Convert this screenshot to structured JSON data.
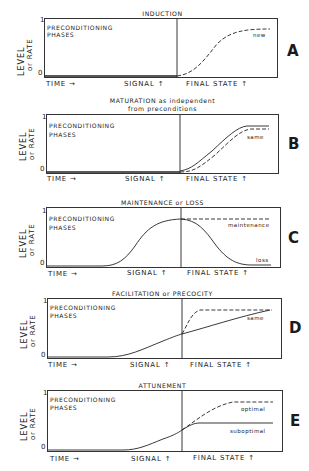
{
  "figure": {
    "y_axis_label_line1": "LEVEL",
    "y_axis_label_line2": "or RATE",
    "y_tick_top": "1",
    "y_tick_bottom": "0",
    "x_label_time": "TIME →",
    "x_label_signal": "SIGNAL ↑",
    "x_label_final": "FINAL STATE ↑",
    "preconditioning_line1": "PRECONDITIONING",
    "preconditioning_line2": "PHASES"
  },
  "panels": [
    {
      "letter": "A",
      "title": "INDUCTION",
      "curves": [
        {
          "style": "dashed",
          "label": "new",
          "description": "rises sigmoidally from 0 after signal to ~0.85"
        }
      ]
    },
    {
      "letter": "B",
      "title_line1": "MATURATION as independent",
      "title_line2": "from preconditions",
      "curves": [
        {
          "style": "solid",
          "label": "",
          "description": "rises from 0 after signal to ~0.85"
        },
        {
          "style": "dashed",
          "label": "same",
          "description": "parallel to solid, slightly lower, ~0.78"
        }
      ]
    },
    {
      "letter": "C",
      "title": "MAINTENANCE or LOSS",
      "curves": [
        {
          "style": "solid",
          "label": "loss",
          "description": "rises during preconditioning to ~0.85 at signal, then falls to ~0.03"
        },
        {
          "style": "dashed",
          "label": "maintenance",
          "description": "stays at ~0.85 after signal"
        }
      ]
    },
    {
      "letter": "D",
      "title": "FACILITATION or PRECOCITY",
      "curves": [
        {
          "style": "solid",
          "label": "same",
          "description": "slow rise from 0 to ~0.38 at signal, continues to ~0.82"
        },
        {
          "style": "dashed",
          "label": "",
          "description": "rapid rise after signal to ~0.82"
        }
      ]
    },
    {
      "letter": "E",
      "title": "ATTUNEMENT",
      "curves": [
        {
          "style": "dashed",
          "label": "optimal",
          "description": "continues rising after signal to ~0.85"
        },
        {
          "style": "solid",
          "label": "suboptimal",
          "description": "plateaus at ~0.42 after signal"
        }
      ]
    }
  ],
  "colors": {
    "ink": "#1a1a1a",
    "background": "#ffffff"
  }
}
